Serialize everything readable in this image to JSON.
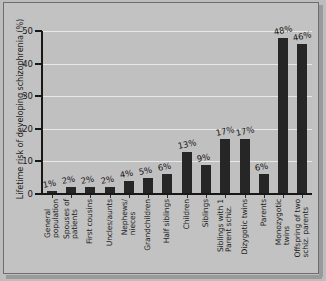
{
  "chart_data": {
    "type": "bar",
    "title": "",
    "xlabel": "",
    "ylabel": "Lifetime risk of developing schizophrenia (%)",
    "ylim": [
      0,
      50
    ],
    "yticks": [
      0,
      10,
      20,
      30,
      40,
      50
    ],
    "ytick_labels": [
      "0",
      "10",
      "20",
      "30",
      "40",
      "50"
    ],
    "grid": true,
    "legend": false,
    "bar_color": "#262626",
    "plot_background": "#c0c0c0",
    "figure_background": "#bdbdbd",
    "gridline_color": "#e8e8e8",
    "axis_color": "#181818",
    "categories": [
      "General population",
      "Spouses of patients",
      "First cousins",
      "Uncles/aunts",
      "Nephews/nieces",
      "Grandchildren",
      "Half siblings",
      "Children",
      "Siblings",
      "Siblings with 1 Parent schiz.",
      "Dizygotic twins",
      "Parents",
      "Monozygotic twins",
      "Offspring of two schiz. parents"
    ],
    "category_lines": [
      [
        "General",
        "population"
      ],
      [
        "Spouses of",
        "patients"
      ],
      [
        "First cousins"
      ],
      [
        "Uncles/aunts"
      ],
      [
        "Nephews/",
        "nieces"
      ],
      [
        "Grandchildren"
      ],
      [
        "Half siblings"
      ],
      [
        "Children"
      ],
      [
        "Siblings"
      ],
      [
        "Siblings with 1",
        "Parent schiz."
      ],
      [
        "Dizygotic twins"
      ],
      [
        "Parents"
      ],
      [
        "Monozygotic",
        "twins"
      ],
      [
        "Offspring of two",
        "schiz. parents"
      ]
    ],
    "values": [
      1,
      2,
      2,
      2,
      4,
      5,
      6,
      13,
      9,
      17,
      17,
      6,
      48,
      46
    ],
    "value_labels": [
      "1%",
      "2%",
      "2%",
      "2%",
      "4%",
      "5%",
      "6%",
      "13%",
      "9%",
      "17%",
      "17%",
      "6%",
      "48%",
      "46%"
    ]
  }
}
